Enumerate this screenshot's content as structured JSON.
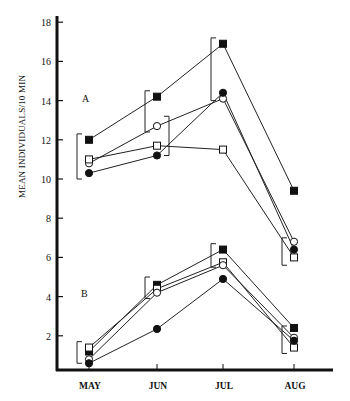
{
  "chart_data": {
    "type": "line",
    "title": "",
    "xlabel": "",
    "ylabel": "MEAN INDIVIDUALS/10 MIN",
    "ylim": [
      0,
      18
    ],
    "yticks": [
      2,
      4,
      6,
      8,
      10,
      12,
      14,
      16,
      18
    ],
    "grid": false,
    "categories": [
      "MAY",
      "JUN",
      "JUL",
      "AUG"
    ],
    "panels": [
      {
        "label": "A",
        "series": [
          {
            "marker": "filled-square",
            "values": [
              12.0,
              14.2,
              16.9,
              9.4
            ]
          },
          {
            "marker": "open-circle",
            "values": [
              10.8,
              12.7,
              14.1,
              6.8
            ]
          },
          {
            "marker": "open-square",
            "values": [
              11.0,
              11.7,
              11.5,
              6.0
            ]
          },
          {
            "marker": "filled-circle",
            "values": [
              10.3,
              11.2,
              14.4,
              6.4
            ]
          }
        ],
        "brackets": [
          {
            "category": "MAY",
            "side": "left",
            "from": 10.0,
            "to": 12.3
          },
          {
            "category": "JUN",
            "side": "left",
            "from": 12.4,
            "to": 14.5
          },
          {
            "category": "JUN",
            "side": "right",
            "from": 11.2,
            "to": 13.2
          },
          {
            "category": "JUL",
            "side": "left",
            "from": 14.0,
            "to": 17.2
          },
          {
            "category": "AUG",
            "side": "left",
            "from": 5.6,
            "to": 7.0
          }
        ]
      },
      {
        "label": "B",
        "series": [
          {
            "marker": "filled-square",
            "values": [
              1.2,
              4.6,
              6.4,
              2.4
            ]
          },
          {
            "marker": "open-square",
            "values": [
              1.4,
              4.4,
              5.75,
              1.4
            ]
          },
          {
            "marker": "open-circle",
            "values": [
              0.8,
              4.2,
              5.6,
              1.9
            ]
          },
          {
            "marker": "filled-circle",
            "values": [
              0.6,
              2.35,
              4.9,
              1.75
            ]
          }
        ],
        "brackets": [
          {
            "category": "MAY",
            "side": "left",
            "from": 0.6,
            "to": 1.7
          },
          {
            "category": "JUN",
            "side": "left",
            "from": 3.9,
            "to": 5.0
          },
          {
            "category": "JUL",
            "side": "left",
            "from": 5.5,
            "to": 6.7
          },
          {
            "category": "AUG",
            "side": "left",
            "from": 1.1,
            "to": 2.5
          }
        ]
      }
    ]
  },
  "axis": {
    "ylabel": "MEAN INDIVIDUALS/10 MIN",
    "ticks": [
      "2",
      "4",
      "6",
      "8",
      "10",
      "12",
      "14",
      "16",
      "18"
    ],
    "months": [
      "MAY",
      "JUN",
      "JUL",
      "AUG"
    ]
  },
  "panels": {
    "a_label": "A",
    "b_label": "B"
  }
}
